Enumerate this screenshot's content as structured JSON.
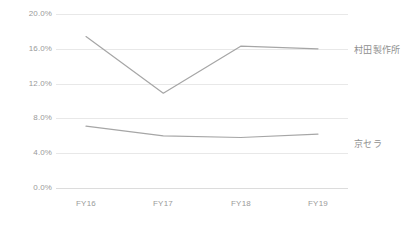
{
  "chart_data": {
    "type": "line",
    "title": "",
    "subtitle": "",
    "xlabel": "",
    "ylabel": "",
    "categories": [
      "FY16",
      "FY17",
      "FY18",
      "FY19"
    ],
    "ylim": [
      0,
      20
    ],
    "ytick_labels": [
      "20.0%",
      "16.0%",
      "12.0%",
      "8.0%",
      "4.0%",
      "0.0%"
    ],
    "ytick_values": [
      20,
      16,
      12,
      8,
      4,
      0
    ],
    "y_unit": "%",
    "grid": true,
    "legend_position": "right-of-line-end",
    "series": [
      {
        "name": "村田製作所",
        "values": [
          17.4,
          10.9,
          16.3,
          16.0
        ],
        "color": "#a6a6a6",
        "label_y_pct": 16.0
      },
      {
        "name": "京セラ",
        "values": [
          7.1,
          6.0,
          5.8,
          6.2
        ],
        "color": "#a6a6a6",
        "label_y_pct": 5.2
      }
    ],
    "colors": {
      "line": "#a6a6a6",
      "gridline": "#e8e8e8",
      "baseline": "#dcdcdc",
      "tick_text": "#9a9a9a",
      "series_label_text": "#8f8f8f",
      "background": "#ffffff"
    }
  }
}
